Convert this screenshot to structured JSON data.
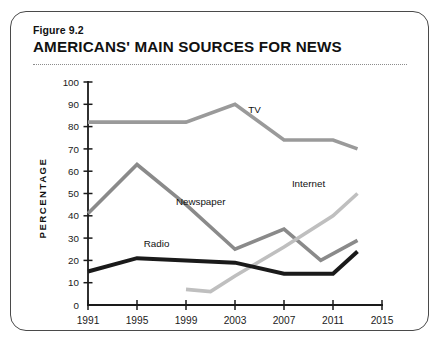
{
  "figure": {
    "number": "Figure 9.2",
    "title": "AMERICANS' MAIN SOURCES FOR NEWS"
  },
  "chart_data": {
    "type": "line",
    "title": "AMERICANS' MAIN SOURCES FOR NEWS",
    "xlabel": "",
    "ylabel": "PERCENTAGE",
    "xlim": [
      1991,
      2015
    ],
    "ylim": [
      0,
      100
    ],
    "grid": false,
    "legend_position": "inline-labels",
    "xticks": [
      "1991",
      "1995",
      "1999",
      "2003",
      "2007",
      "2011",
      "2015"
    ],
    "yticks": [
      "0",
      "10",
      "20",
      "30",
      "40",
      "50",
      "60",
      "70",
      "80",
      "90",
      "100"
    ],
    "series": [
      {
        "name": "TV",
        "color": "#9a9a9a",
        "label_x": 2004.6,
        "label_y": 86,
        "x": [
          1991,
          1995,
          1999,
          2003,
          2007,
          2011,
          2013
        ],
        "values": [
          82,
          82,
          82,
          90,
          74,
          74,
          70
        ]
      },
      {
        "name": "Newspaper",
        "color": "#8a8a8a",
        "label_x": 2000.2,
        "label_y": 45,
        "x": [
          1991,
          1995,
          1999,
          2003,
          2007,
          2010,
          2013
        ],
        "values": [
          41,
          63,
          45,
          25,
          34,
          20,
          29
        ]
      },
      {
        "name": "Internet",
        "color": "#bfbfbf",
        "label_x": 2009.0,
        "label_y": 53,
        "x": [
          1999,
          2001,
          2003,
          2007,
          2011,
          2013
        ],
        "values": [
          7,
          6,
          13,
          26,
          40,
          50
        ]
      },
      {
        "name": "Radio",
        "color": "#1a1a1a",
        "label_x": 1996.6,
        "label_y": 26,
        "x": [
          1991,
          1995,
          1999,
          2003,
          2007,
          2011,
          2013
        ],
        "values": [
          15,
          21,
          20,
          19,
          14,
          14,
          24
        ]
      }
    ]
  }
}
